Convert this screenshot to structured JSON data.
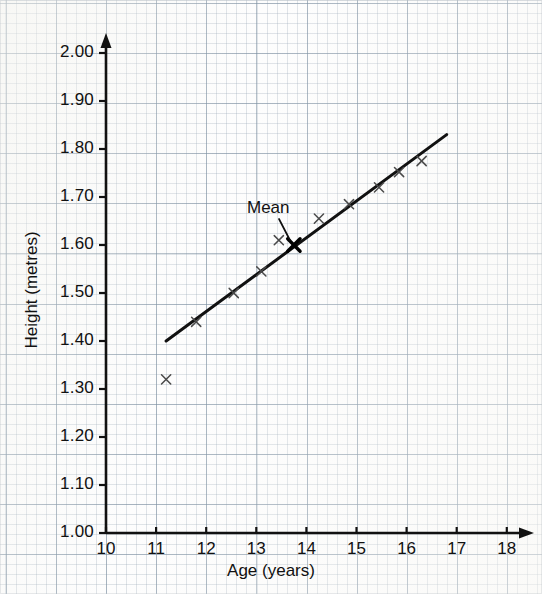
{
  "chart_data": {
    "type": "scatter",
    "title": "",
    "xlabel": "Age (years)",
    "ylabel": "Height (metres)",
    "xlim": [
      10,
      18
    ],
    "ylim": [
      1.0,
      2.0
    ],
    "xticks": [
      "10",
      "11",
      "12",
      "13",
      "14",
      "15",
      "16",
      "17",
      "18"
    ],
    "yticks": [
      "1.00",
      "1.10",
      "1.20",
      "1.30",
      "1.40",
      "1.50",
      "1.60",
      "1.70",
      "1.80",
      "1.90",
      "2.00"
    ],
    "xtick_values": [
      10,
      11,
      12,
      13,
      14,
      15,
      16,
      17,
      18
    ],
    "ytick_values": [
      1.0,
      1.1,
      1.2,
      1.3,
      1.4,
      1.5,
      1.6,
      1.7,
      1.8,
      1.9,
      2.0
    ],
    "grid": true,
    "grid_style": "graph-paper",
    "legend": "none",
    "marker": "x",
    "marker_color": "#4a4a4a",
    "points": [
      {
        "x": 11.2,
        "y": 1.32,
        "label": "outlier"
      },
      {
        "x": 11.8,
        "y": 1.44,
        "label": ""
      },
      {
        "x": 12.55,
        "y": 1.5,
        "label": ""
      },
      {
        "x": 13.1,
        "y": 1.545,
        "label": ""
      },
      {
        "x": 13.45,
        "y": 1.61,
        "label": ""
      },
      {
        "x": 14.25,
        "y": 1.655,
        "label": ""
      },
      {
        "x": 14.85,
        "y": 1.685,
        "label": ""
      },
      {
        "x": 15.45,
        "y": 1.72,
        "label": ""
      },
      {
        "x": 15.85,
        "y": 1.752,
        "label": ""
      },
      {
        "x": 16.3,
        "y": 1.775,
        "label": ""
      }
    ],
    "mean_point": {
      "x": 13.75,
      "y": 1.6,
      "label": "Mean",
      "marker": "filled-cross"
    },
    "line_of_best_fit": {
      "x1": 11.2,
      "y1": 1.4,
      "x2": 16.8,
      "y2": 1.83,
      "color": "#111111",
      "width": 3
    },
    "annotations": [
      {
        "text": "Mean",
        "x": 13.0,
        "y": 1.665,
        "points_to": {
          "x": 13.75,
          "y": 1.6
        }
      }
    ],
    "axis_arrows": [
      "x-right",
      "y-up"
    ],
    "axis_color": "#111111"
  }
}
